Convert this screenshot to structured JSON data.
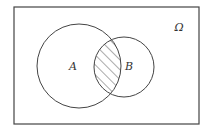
{
  "diagram": {
    "type": "venn",
    "universe": {
      "label": "Ω",
      "x": 14,
      "y": 7,
      "width": 185,
      "height": 117
    },
    "sets": [
      {
        "label": "A",
        "cx": 79,
        "cy": 66,
        "r": 42
      },
      {
        "label": "B",
        "cx": 124,
        "cy": 67,
        "r": 30
      }
    ],
    "shaded_region": "A ∩ B",
    "shading_style": "diagonal-hatch",
    "colors": {
      "stroke": "#444444",
      "background": "#ffffff",
      "text": "#333333"
    }
  }
}
